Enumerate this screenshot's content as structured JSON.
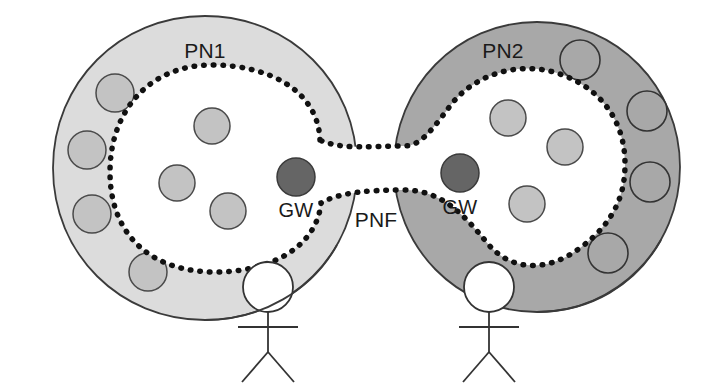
{
  "diagram": {
    "canvas": {
      "width": 727,
      "height": 391,
      "background": "#ffffff"
    },
    "colors": {
      "pn1_fill": "#dcdcdc",
      "pn2_fill": "#a8a8a8",
      "inner_fill": "#ffffff",
      "node_fill": "#c3c3c3",
      "pn2_outer_node_fill": "#a8a8a8",
      "gateway_fill": "#656565",
      "outline": "#3a3a3a",
      "dotted_boundary": "#111111",
      "text": "#1a1a1a"
    },
    "networks": [
      {
        "id": "pn1",
        "label": "PN1",
        "label_x": 205,
        "label_y": 58,
        "fill": "#dcdcdc",
        "center": {
          "cx": 205,
          "cy": 168
        },
        "radius": 152,
        "outer_nodes": [
          {
            "cx": 115,
            "cy": 93,
            "r": 19,
            "fill": "#c3c3c3"
          },
          {
            "cx": 87,
            "cy": 150,
            "r": 19,
            "fill": "#c3c3c3"
          },
          {
            "cx": 92,
            "cy": 214,
            "r": 19,
            "fill": "#c3c3c3"
          },
          {
            "cx": 148,
            "cy": 272,
            "r": 19,
            "fill": "#c3c3c3"
          }
        ],
        "inner_nodes": [
          {
            "cx": 212,
            "cy": 126,
            "r": 18,
            "fill": "#c3c3c3"
          },
          {
            "cx": 177,
            "cy": 183,
            "r": 18,
            "fill": "#c3c3c3"
          },
          {
            "cx": 228,
            "cy": 211,
            "r": 18,
            "fill": "#c3c3c3"
          }
        ],
        "gateway": {
          "label": "GW",
          "cx": 296,
          "cy": 177,
          "r": 19,
          "label_x": 296,
          "label_y": 217
        }
      },
      {
        "id": "pn2",
        "label": "PN2",
        "label_x": 503,
        "label_y": 58,
        "fill": "#a8a8a8",
        "center": {
          "cx": 537,
          "cy": 167
        },
        "radius": 145,
        "outer_nodes": [
          {
            "cx": 580,
            "cy": 60,
            "r": 20,
            "fill": "#a8a8a8"
          },
          {
            "cx": 647,
            "cy": 111,
            "r": 20,
            "fill": "#a8a8a8"
          },
          {
            "cx": 650,
            "cy": 182,
            "r": 20,
            "fill": "#a8a8a8"
          },
          {
            "cx": 608,
            "cy": 253,
            "r": 20,
            "fill": "#a8a8a8"
          }
        ],
        "inner_nodes": [
          {
            "cx": 508,
            "cy": 118,
            "r": 18,
            "fill": "#c3c3c3"
          },
          {
            "cx": 565,
            "cy": 147,
            "r": 18,
            "fill": "#c3c3c3"
          },
          {
            "cx": 527,
            "cy": 204,
            "r": 18,
            "fill": "#c3c3c3"
          }
        ],
        "gateway": {
          "label": "GW",
          "cx": 460,
          "cy": 173,
          "r": 19,
          "label_x": 460,
          "label_y": 214
        }
      }
    ],
    "federation_link": {
      "label": "PNF",
      "label_x": 376,
      "label_y": 227
    },
    "actors": [
      {
        "id": "actor-pn1",
        "head_cx": 268,
        "head_cy": 287,
        "head_r": 25,
        "body_top": 312,
        "body_bottom": 352,
        "arm_y": 327,
        "arm_half": 30,
        "leg_dx": 26,
        "leg_y": 382
      },
      {
        "id": "actor-pn2",
        "head_cx": 489,
        "head_cy": 287,
        "head_r": 25,
        "body_top": 312,
        "body_bottom": 352,
        "arm_y": 327,
        "arm_half": 30,
        "leg_dx": 26,
        "leg_y": 382
      }
    ]
  }
}
